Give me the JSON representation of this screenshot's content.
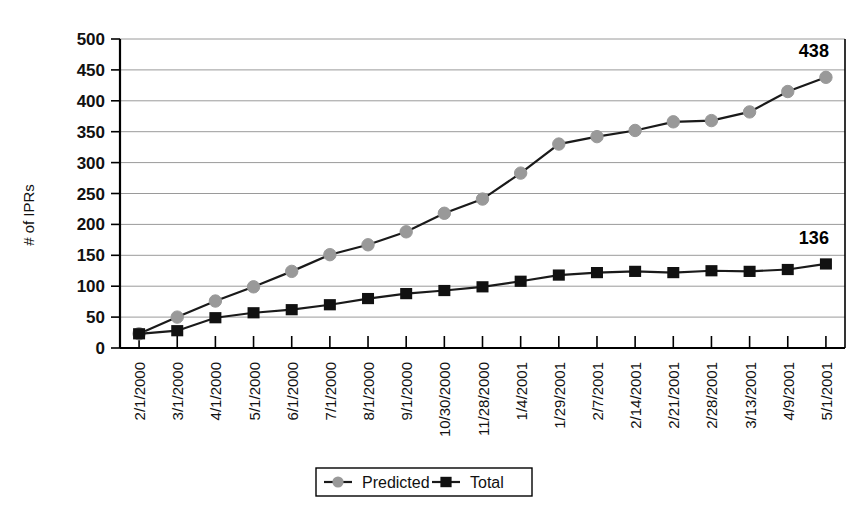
{
  "chart_data": {
    "type": "line",
    "title": "",
    "xlabel": "",
    "ylabel": "# of IPRs",
    "ylim": [
      0,
      500
    ],
    "ytick_step": 50,
    "yticks": [
      "0",
      "50",
      "100",
      "150",
      "200",
      "250",
      "300",
      "350",
      "400",
      "450",
      "500"
    ],
    "grid": true,
    "legend_position": "bottom-center",
    "categories": [
      "2/1/2000",
      "3/1/2000",
      "4/1/2000",
      "5/1/2000",
      "6/1/2000",
      "7/1/2000",
      "8/1/2000",
      "9/1/2000",
      "10/30/2000",
      "11/28/2000",
      "1/4/2001",
      "1/29/2001",
      "2/7/2001",
      "2/14/2001",
      "2/21/2001",
      "2/28/2001",
      "3/13/2001",
      "4/9/2001",
      "5/1/2001"
    ],
    "series": [
      {
        "name": "Predicted",
        "marker": "circle",
        "color": "#999999",
        "line_color": "#1a1a1a",
        "values": [
          23,
          50,
          76,
          99,
          124,
          151,
          167,
          188,
          218,
          241,
          283,
          330,
          342,
          352,
          366,
          368,
          382,
          415,
          438
        ]
      },
      {
        "name": "Total",
        "marker": "square",
        "color": "#111111",
        "line_color": "#1a1a1a",
        "values": [
          23,
          28,
          49,
          57,
          62,
          70,
          80,
          88,
          93,
          99,
          108,
          118,
          122,
          124,
          122,
          125,
          124,
          127,
          136
        ]
      }
    ],
    "annotations": [
      {
        "text": "438",
        "series": "Predicted",
        "category": "5/1/2001",
        "value": 438
      },
      {
        "text": "136",
        "series": "Total",
        "category": "5/1/2001",
        "value": 136
      }
    ]
  },
  "legend": {
    "items": [
      {
        "label": "Predicted",
        "marker": "circle",
        "color": "#999999"
      },
      {
        "label": "Total",
        "marker": "square",
        "color": "#111111"
      }
    ]
  }
}
